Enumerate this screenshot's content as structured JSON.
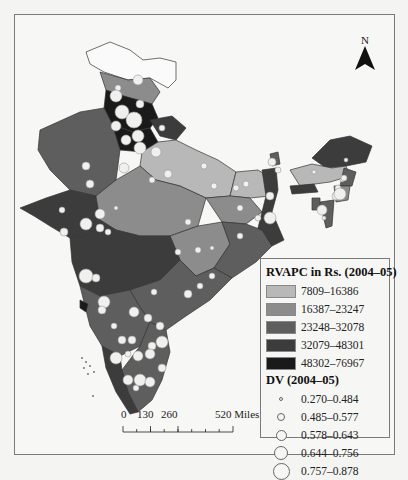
{
  "figure": {
    "north_label": "N",
    "scale_bar": {
      "ticks": [
        "0",
        "130",
        "260",
        "520 Miles"
      ]
    }
  },
  "legend": {
    "rvapc_title": "RVAPC in Rs. (2004–05)",
    "rvapc_classes": [
      {
        "label": "7809–16386",
        "color": "#b8b8b8"
      },
      {
        "label": "16387–23247",
        "color": "#8c8c8c"
      },
      {
        "label": "23248–32078",
        "color": "#5e5e5e"
      },
      {
        "label": "32079–48301",
        "color": "#3c3c3c"
      },
      {
        "label": "48302–76967",
        "color": "#1a1a1a"
      }
    ],
    "dv_title": "DV (2004–05)",
    "dv_classes": [
      {
        "label": "0.270–0.484",
        "size": 4
      },
      {
        "label": "0.485–0.577",
        "size": 8
      },
      {
        "label": "0.578–0.643",
        "size": 11
      },
      {
        "label": "0.644–0.756",
        "size": 14
      },
      {
        "label": "0.757–0.878",
        "size": 17
      }
    ]
  }
}
